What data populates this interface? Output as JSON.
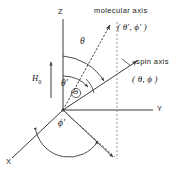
{
  "figure": {
    "type": "vector-diagram",
    "background_color": "#ffffff",
    "line_color": "#3a3a3a",
    "text_color": "#1a1a1a"
  },
  "axes": {
    "z_label": "Z",
    "y_label": "Y",
    "x_label": "X"
  },
  "vectors": {
    "molecular_axis": {
      "title": "molecular axis",
      "coords": "( θ′, ϕ′ )",
      "style": "dashed"
    },
    "spin_axis": {
      "title": "spin axis",
      "coords": "( θ, ϕ )",
      "style": "solid"
    },
    "field": {
      "label_html": "H<sub>0</sub>",
      "label_text": "H0"
    }
  },
  "angles": {
    "theta": "θ",
    "theta_prime": "θ′",
    "phi_prime": "ϕ′",
    "big_theta": "Θ"
  }
}
